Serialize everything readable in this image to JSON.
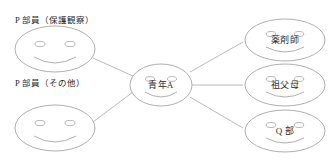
{
  "diagram": {
    "title": "",
    "background_color": "#ffffff",
    "stroke_color": "#9a9a9a",
    "text_color": "#2b2b2b",
    "captions": [
      {
        "id": "caption-probation",
        "text": "P 部員（保護観察）"
      },
      {
        "id": "caption-other",
        "text": "P 部員（その他）"
      }
    ],
    "nodes": [
      {
        "id": "node-p-probation",
        "label": "",
        "icon": "smiley-face-icon",
        "role": "group-member"
      },
      {
        "id": "node-p-other",
        "label": "",
        "icon": "smiley-face-icon",
        "role": "group-member"
      },
      {
        "id": "node-center",
        "label": "青年A",
        "icon": "smiley-face-icon",
        "role": "center"
      },
      {
        "id": "node-pharmacist",
        "label": "薬剤師",
        "icon": "smiley-face-icon",
        "role": "relation"
      },
      {
        "id": "node-grandparents",
        "label": "祖父母",
        "icon": "smiley-face-icon",
        "role": "relation"
      },
      {
        "id": "node-q-club",
        "label": "Q 部",
        "icon": "smiley-face-icon",
        "role": "relation"
      }
    ],
    "edges": [
      {
        "id": "edge-probation-center",
        "from": "node-p-probation",
        "to": "node-center"
      },
      {
        "id": "edge-other-center",
        "from": "node-p-other",
        "to": "node-center"
      },
      {
        "id": "edge-center-pharmacist",
        "from": "node-center",
        "to": "node-pharmacist"
      },
      {
        "id": "edge-center-grandparents",
        "from": "node-center",
        "to": "node-grandparents"
      },
      {
        "id": "edge-center-q-club",
        "from": "node-center",
        "to": "node-q-club"
      }
    ]
  }
}
